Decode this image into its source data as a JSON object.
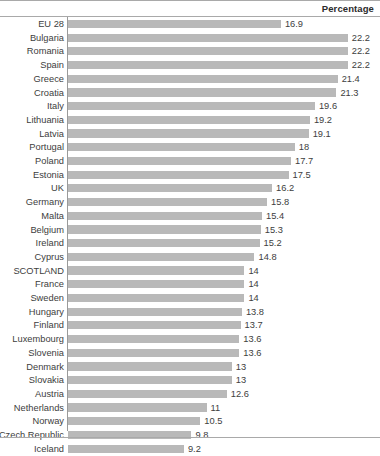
{
  "header": {
    "title": "Percentage"
  },
  "style": {
    "bar_color": "#b9b9b9",
    "axis_color": "#9a9a9a",
    "frame_color": "#a9a9a9",
    "text_color": "#3d3d3d"
  },
  "chart_data": {
    "type": "bar",
    "orientation": "horizontal",
    "title": "",
    "subtitle": "",
    "xlabel": "Percentage",
    "ylabel": "",
    "legend": [],
    "grid": false,
    "xlim": [
      0,
      22.2
    ],
    "px_per_unit": 12.6,
    "categories": [
      "EU 28",
      "Bulgaria",
      "Romania",
      "Spain",
      "Greece",
      "Croatia",
      "Italy",
      "Lithuania",
      "Latvia",
      "Portugal",
      "Poland",
      "Estonia",
      "UK",
      "Germany",
      "Malta",
      "Belgium",
      "Ireland",
      "Cyprus",
      "SCOTLAND",
      "France",
      "Sweden",
      "Hungary",
      "Finland",
      "Luxembourg",
      "Slovenia",
      "Denmark",
      "Slovakia",
      "Austria",
      "Netherlands",
      "Norway",
      "Czech Republic",
      "Iceland"
    ],
    "values": [
      16.9,
      22.2,
      22.2,
      22.2,
      21.4,
      21.3,
      19.6,
      19.2,
      19.1,
      18,
      17.7,
      17.5,
      16.2,
      15.8,
      15.4,
      15.3,
      15.2,
      14.8,
      14,
      14,
      14,
      13.8,
      13.7,
      13.6,
      13.6,
      13,
      13,
      12.6,
      11,
      10.5,
      9.8,
      9.2
    ],
    "value_labels": [
      "16.9",
      "22.2",
      "22.2",
      "22.2",
      "21.4",
      "21.3",
      "19.6",
      "19.2",
      "19.1",
      "18",
      "17.7",
      "17.5",
      "16.2",
      "15.8",
      "15.4",
      "15.3",
      "15.2",
      "14.8",
      "14",
      "14",
      "14",
      "13.8",
      "13.7",
      "13.6",
      "13.6",
      "13",
      "13",
      "12.6",
      "11",
      "10.5",
      "9.8",
      "9.2"
    ]
  }
}
